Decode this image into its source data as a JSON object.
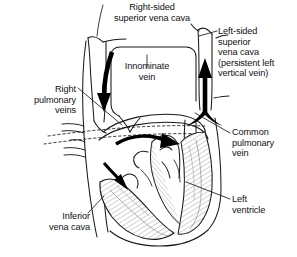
{
  "figure": {
    "type": "anatomical line drawing",
    "background_color": "#ffffff",
    "ink_color": "#111111",
    "width": 297,
    "height": 257
  },
  "labels": {
    "right_svc": "Right-sided\nsuperior vena cava",
    "left_svc": "Left-sided\nsuperior\nvena cava\n(persistent left\nvertical vein)",
    "innominate_vein": "Innominate\nvein",
    "right_pulmonary_veins": "Right\npulmonary\nveins",
    "common_pulmonary_vein": "Common\npulmonary\nvein",
    "left_ventricle": "Left\nventricle",
    "inferior_vena_cava": "Inferior\nvena cava"
  },
  "flow_arrows": [
    {
      "name": "right-svc-downward-flow",
      "direction": "down"
    },
    {
      "name": "left-svc-upward-flow",
      "direction": "up"
    },
    {
      "name": "atrial-rightward-flow",
      "direction": "right"
    },
    {
      "name": "atrial-descending-flow",
      "direction": "down-right"
    }
  ]
}
